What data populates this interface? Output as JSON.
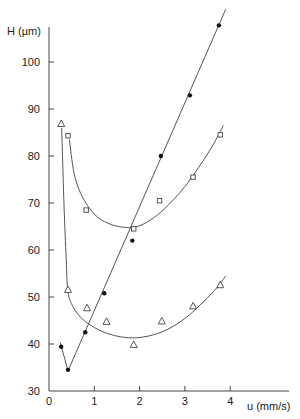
{
  "chart_data": {
    "type": "scatter",
    "title": "",
    "xlabel": "u (mm/s)",
    "ylabel": "H (µm)",
    "xlim": [
      0,
      4.25
    ],
    "ylim": [
      30,
      109
    ],
    "x_ticks": [
      0,
      1,
      2,
      3,
      4
    ],
    "y_ticks": [
      30,
      40,
      50,
      60,
      70,
      80,
      90,
      100
    ],
    "grid": false,
    "legend": "none",
    "series": [
      {
        "name": "filled-circles",
        "marker": "filled-circle",
        "points": [
          {
            "x": 0.27,
            "y": 39.4
          },
          {
            "x": 0.42,
            "y": 34.5
          },
          {
            "x": 0.8,
            "y": 42.5
          },
          {
            "x": 1.22,
            "y": 50.8
          },
          {
            "x": 1.84,
            "y": 62.0
          },
          {
            "x": 2.47,
            "y": 80.0
          },
          {
            "x": 3.11,
            "y": 92.9
          },
          {
            "x": 3.75,
            "y": 107.8
          }
        ],
        "fit_curve": [
          {
            "x": 0.25,
            "y": 40.3
          },
          {
            "x": 0.42,
            "y": 34.3
          },
          {
            "x": 3.9,
            "y": 111.2
          }
        ]
      },
      {
        "name": "open-squares",
        "marker": "open-square",
        "points": [
          {
            "x": 0.42,
            "y": 84.3
          },
          {
            "x": 0.82,
            "y": 68.5
          },
          {
            "x": 1.87,
            "y": 64.5
          },
          {
            "x": 2.44,
            "y": 70.5
          },
          {
            "x": 3.18,
            "y": 75.5
          },
          {
            "x": 3.78,
            "y": 84.5
          }
        ],
        "fit_curve": [
          {
            "x": 0.45,
            "y": 83.5
          },
          {
            "x": 0.55,
            "y": 76.5
          },
          {
            "x": 0.7,
            "y": 72.0
          },
          {
            "x": 0.9,
            "y": 68.8
          },
          {
            "x": 1.1,
            "y": 66.8
          },
          {
            "x": 1.35,
            "y": 65.5
          },
          {
            "x": 1.6,
            "y": 64.9
          },
          {
            "x": 1.85,
            "y": 64.8
          },
          {
            "x": 2.1,
            "y": 65.6
          },
          {
            "x": 2.4,
            "y": 67.5
          },
          {
            "x": 2.7,
            "y": 70.2
          },
          {
            "x": 3.0,
            "y": 73.5
          },
          {
            "x": 3.3,
            "y": 77.5
          },
          {
            "x": 3.6,
            "y": 82.0
          },
          {
            "x": 3.85,
            "y": 86.5
          }
        ]
      },
      {
        "name": "open-triangles",
        "marker": "open-triangle",
        "points": [
          {
            "x": 0.27,
            "y": 86.8
          },
          {
            "x": 0.42,
            "y": 51.5
          },
          {
            "x": 0.84,
            "y": 47.6
          },
          {
            "x": 1.27,
            "y": 44.7
          },
          {
            "x": 1.87,
            "y": 39.8
          },
          {
            "x": 2.49,
            "y": 44.8
          },
          {
            "x": 3.18,
            "y": 48.0
          },
          {
            "x": 3.78,
            "y": 52.5
          }
        ],
        "fit_curve": [
          {
            "x": 0.28,
            "y": 86.0
          },
          {
            "x": 0.33,
            "y": 70.0
          },
          {
            "x": 0.38,
            "y": 58.0
          },
          {
            "x": 0.42,
            "y": 51.0
          },
          {
            "x": 0.55,
            "y": 47.6
          },
          {
            "x": 0.75,
            "y": 45.2
          },
          {
            "x": 1.0,
            "y": 43.5
          },
          {
            "x": 1.3,
            "y": 42.2
          },
          {
            "x": 1.6,
            "y": 41.5
          },
          {
            "x": 1.9,
            "y": 41.3
          },
          {
            "x": 2.2,
            "y": 41.7
          },
          {
            "x": 2.5,
            "y": 42.6
          },
          {
            "x": 2.8,
            "y": 44.1
          },
          {
            "x": 3.1,
            "y": 46.2
          },
          {
            "x": 3.4,
            "y": 48.9
          },
          {
            "x": 3.7,
            "y": 51.9
          },
          {
            "x": 3.9,
            "y": 54.5
          }
        ]
      }
    ]
  }
}
